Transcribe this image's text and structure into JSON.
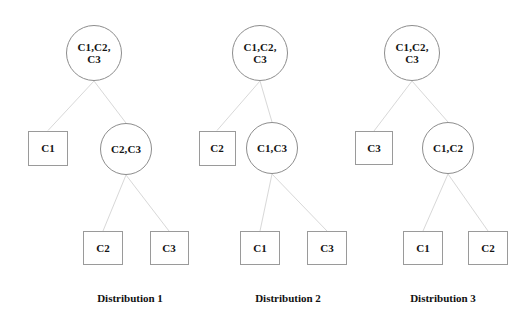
{
  "figure": {
    "type": "tree-diagram",
    "background_color": "#ffffff",
    "node_border_color": "#8d8d8d",
    "edge_color": "#d8d8d8",
    "text_color": "#141414"
  },
  "trees": [
    {
      "id": "distribution-1",
      "caption": "Distribution 1",
      "caption_x": 130,
      "caption_y": 292,
      "nodes": [
        {
          "id": "d1-root",
          "shape": "circle",
          "label": "C1,C2,\nC3",
          "cx": 94,
          "cy": 53,
          "r": 28
        },
        {
          "id": "d1-left",
          "shape": "box",
          "label": "C1",
          "cx": 48,
          "cy": 148,
          "w": 40,
          "h": 35
        },
        {
          "id": "d1-right",
          "shape": "circle",
          "label": "C2,C3",
          "cx": 126,
          "cy": 149,
          "r": 26
        },
        {
          "id": "d1-leaf1",
          "shape": "box",
          "label": "C2",
          "cx": 103,
          "cy": 248,
          "w": 40,
          "h": 34
        },
        {
          "id": "d1-leaf2",
          "shape": "box",
          "label": "C3",
          "cx": 169,
          "cy": 248,
          "w": 39,
          "h": 34
        }
      ],
      "edges": [
        {
          "from": "d1-root",
          "to": "d1-left"
        },
        {
          "from": "d1-root",
          "to": "d1-right"
        },
        {
          "from": "d1-right",
          "to": "d1-leaf1"
        },
        {
          "from": "d1-right",
          "to": "d1-leaf2"
        }
      ]
    },
    {
      "id": "distribution-2",
      "caption": "Distribution 2",
      "caption_x": 288,
      "caption_y": 292,
      "nodes": [
        {
          "id": "d2-root",
          "shape": "circle",
          "label": "C1,C2,\nC3",
          "cx": 260,
          "cy": 53,
          "r": 28
        },
        {
          "id": "d2-left",
          "shape": "box",
          "label": "C2",
          "cx": 217,
          "cy": 148,
          "w": 37,
          "h": 35
        },
        {
          "id": "d2-right",
          "shape": "circle",
          "label": "C1,C3",
          "cx": 272,
          "cy": 148,
          "r": 26
        },
        {
          "id": "d2-leaf1",
          "shape": "box",
          "label": "C1",
          "cx": 260,
          "cy": 248,
          "w": 40,
          "h": 34
        },
        {
          "id": "d2-leaf2",
          "shape": "box",
          "label": "C3",
          "cx": 327,
          "cy": 248,
          "w": 40,
          "h": 34
        }
      ],
      "edges": [
        {
          "from": "d2-root",
          "to": "d2-left"
        },
        {
          "from": "d2-root",
          "to": "d2-right"
        },
        {
          "from": "d2-right",
          "to": "d2-leaf1"
        },
        {
          "from": "d2-right",
          "to": "d2-leaf2"
        }
      ]
    },
    {
      "id": "distribution-3",
      "caption": "Distribution 3",
      "caption_x": 443,
      "caption_y": 292,
      "nodes": [
        {
          "id": "d3-root",
          "shape": "circle",
          "label": "C1,C2,\nC3",
          "cx": 412,
          "cy": 53,
          "r": 28
        },
        {
          "id": "d3-left",
          "shape": "box",
          "label": "C3",
          "cx": 374,
          "cy": 148,
          "w": 38,
          "h": 34
        },
        {
          "id": "d3-right",
          "shape": "circle",
          "label": "C1,C2",
          "cx": 448,
          "cy": 148,
          "r": 26
        },
        {
          "id": "d3-leaf1",
          "shape": "box",
          "label": "C1",
          "cx": 423,
          "cy": 248,
          "w": 40,
          "h": 34
        },
        {
          "id": "d3-leaf2",
          "shape": "box",
          "label": "C2",
          "cx": 488,
          "cy": 248,
          "w": 40,
          "h": 34
        }
      ],
      "edges": [
        {
          "from": "d3-root",
          "to": "d3-left"
        },
        {
          "from": "d3-root",
          "to": "d3-right"
        },
        {
          "from": "d3-right",
          "to": "d3-leaf1"
        },
        {
          "from": "d3-right",
          "to": "d3-leaf2"
        }
      ]
    }
  ]
}
